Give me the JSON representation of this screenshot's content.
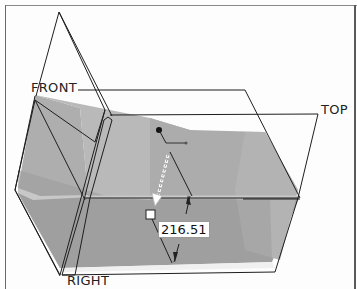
{
  "viewport": {
    "planes": [
      {
        "id": "front",
        "label": "FRONT"
      },
      {
        "id": "top",
        "label": "TOP"
      },
      {
        "id": "right",
        "label": "RIGHT"
      }
    ],
    "dimension": {
      "value": "216.51"
    },
    "colors": {
      "solid_light": "#b8b8b8",
      "solid_mid": "#a6a6a6",
      "solid_dark": "#9a9a9a",
      "edge_line": "#1e1e1e",
      "background": "#fdfdfd"
    }
  }
}
